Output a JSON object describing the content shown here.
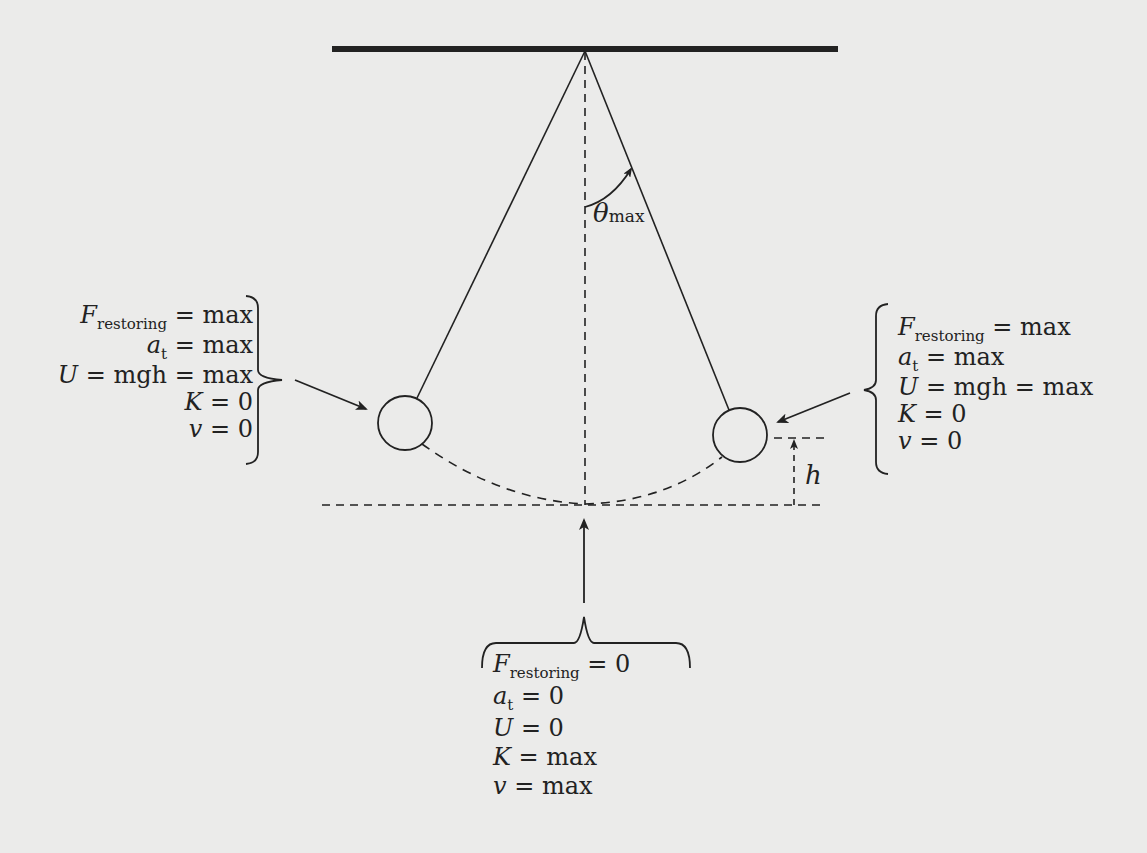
{
  "figure": {
    "colors": {
      "background": "#ebebea",
      "ink": "#222222"
    },
    "angle_label": {
      "symbol": "θ",
      "subscript": "max"
    },
    "height_label": "h",
    "left_extreme": {
      "equations": [
        {
          "lhs_var": "F",
          "lhs_sub": "restoring",
          "rhs": "= max"
        },
        {
          "lhs_var": "a",
          "lhs_sub": "t",
          "rhs": "= max"
        },
        {
          "lhs_var": "U",
          "lhs_sub": "",
          "rhs": "= mgh = max",
          "rhs_var": "mgh"
        },
        {
          "lhs_var": "K",
          "lhs_sub": "",
          "rhs": "= 0"
        },
        {
          "lhs_var": "v",
          "lhs_sub": "",
          "rhs": "= 0"
        }
      ]
    },
    "right_extreme": {
      "equations": [
        {
          "lhs_var": "F",
          "lhs_sub": "restoring",
          "rhs": "=  max"
        },
        {
          "lhs_var": "a",
          "lhs_sub": "t",
          "rhs": "= max"
        },
        {
          "lhs_var": "U",
          "lhs_sub": "",
          "rhs": "= mgh = max",
          "rhs_var": "mgh"
        },
        {
          "lhs_var": "K",
          "lhs_sub": "",
          "rhs": "= 0"
        },
        {
          "lhs_var": "v",
          "lhs_sub": "",
          "rhs": "= 0"
        }
      ]
    },
    "bottom": {
      "equations": [
        {
          "lhs_var": "F",
          "lhs_sub": "restoring",
          "rhs": "= 0"
        },
        {
          "lhs_var": "a",
          "lhs_sub": "t",
          "rhs": "= 0"
        },
        {
          "lhs_var": "U",
          "lhs_sub": "",
          "rhs": "= 0"
        },
        {
          "lhs_var": "K",
          "lhs_sub": "",
          "rhs": "= max"
        },
        {
          "lhs_var": "v",
          "lhs_sub": "",
          "rhs": "= max"
        }
      ]
    },
    "geometry": {
      "ceiling": {
        "x1": 332,
        "x2": 838,
        "y": 49
      },
      "pivot": {
        "x": 585,
        "y": 50
      },
      "left_bob": {
        "cx": 405,
        "cy": 423,
        "r": 27
      },
      "right_bob": {
        "cx": 740,
        "cy": 435,
        "r": 27
      },
      "reference_line_y": 505
    }
  }
}
